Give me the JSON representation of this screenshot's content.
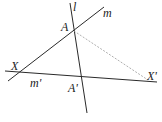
{
  "diagram": {
    "colors": {
      "line": "#2a2a2a",
      "dashed": "#9a9a9a",
      "background": "#ffffff"
    },
    "lines": [
      {
        "id": "l",
        "x1": 70,
        "y1": 3,
        "x2": 87,
        "y2": 113
      },
      {
        "id": "m",
        "x1": 8,
        "y1": 81,
        "x2": 104,
        "y2": 7
      },
      {
        "id": "m_prime",
        "x1": 5,
        "y1": 71,
        "x2": 157,
        "y2": 82
      },
      {
        "id": "AX_prime",
        "x1": 74,
        "y1": 31,
        "x2": 148,
        "y2": 80,
        "dashed": true
      }
    ],
    "labels": {
      "l": "l",
      "m": "m",
      "A": "A",
      "X": "X",
      "m_prime": "m'",
      "A_prime": "A'",
      "X_prime": "X'"
    }
  }
}
